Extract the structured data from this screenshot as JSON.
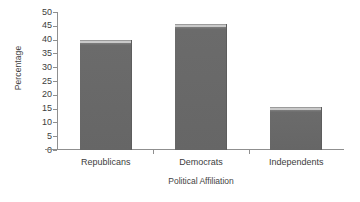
{
  "chart_data": {
    "type": "bar",
    "title": "",
    "subtitle": "",
    "categories": [
      "Republicans",
      "Democrats",
      "Independents"
    ],
    "values": [
      40,
      45.5,
      15.5
    ],
    "xlabel": "Political Affiliation",
    "ylabel": "Percentage",
    "ylim": [
      0,
      50
    ],
    "ytick_labels": [
      "50",
      "45",
      "40",
      "35",
      "30",
      "25",
      "20",
      "15",
      "10",
      "5",
      "0"
    ],
    "ytick_values": [
      50,
      45,
      40,
      35,
      30,
      25,
      20,
      15,
      10,
      5,
      0
    ],
    "ytick_step": 5,
    "grid": false,
    "legend": null,
    "legend_position": "none",
    "bar_color": "#6b6b6b",
    "bar_top_highlight_color": "#c9c9c9",
    "axis_color": "#8f8f8f",
    "background_color": "#ffffff",
    "text_color": "#3d3d3d"
  }
}
